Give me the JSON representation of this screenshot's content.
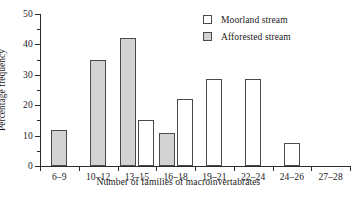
{
  "chart_data": {
    "type": "bar",
    "title": "",
    "xlabel": "Number of families of macroinvertabrates",
    "ylabel": "Percentage frequency",
    "categories": [
      "6–9",
      "10–12",
      "13–15",
      "16–18",
      "19–21",
      "22–24",
      "24–26",
      "27–28"
    ],
    "series": [
      {
        "name": "Moorland stream",
        "style": "open",
        "color": "#ffffff",
        "values": [
          0,
          0,
          15,
          22,
          28.5,
          28.5,
          7.5,
          0
        ]
      },
      {
        "name": "Afforested stream",
        "style": "filled",
        "color": "#d2d2d2",
        "values": [
          12,
          35,
          42,
          11,
          0,
          0,
          0,
          0
        ]
      }
    ],
    "ylim": [
      0,
      50
    ],
    "yticks": [
      0,
      10,
      20,
      30,
      40,
      50
    ],
    "yminorticks": [
      5,
      15,
      25,
      35,
      45
    ],
    "grid": false,
    "legend_position": "top-right"
  },
  "legend": {
    "entries": [
      {
        "label": "Moorland stream",
        "style": "open"
      },
      {
        "label": "Afforested stream",
        "style": "filled"
      }
    ]
  },
  "axis": {
    "y_label": "Percentage frequency",
    "x_label": "Number of families of macroinvertabrates",
    "y_tick_labels": [
      "0",
      "10",
      "20",
      "30",
      "40",
      "50"
    ],
    "x_tick_labels": [
      "6–9",
      "10–12",
      "13–15",
      "16–18",
      "19–21",
      "22–24",
      "24–26",
      "27–28"
    ]
  }
}
